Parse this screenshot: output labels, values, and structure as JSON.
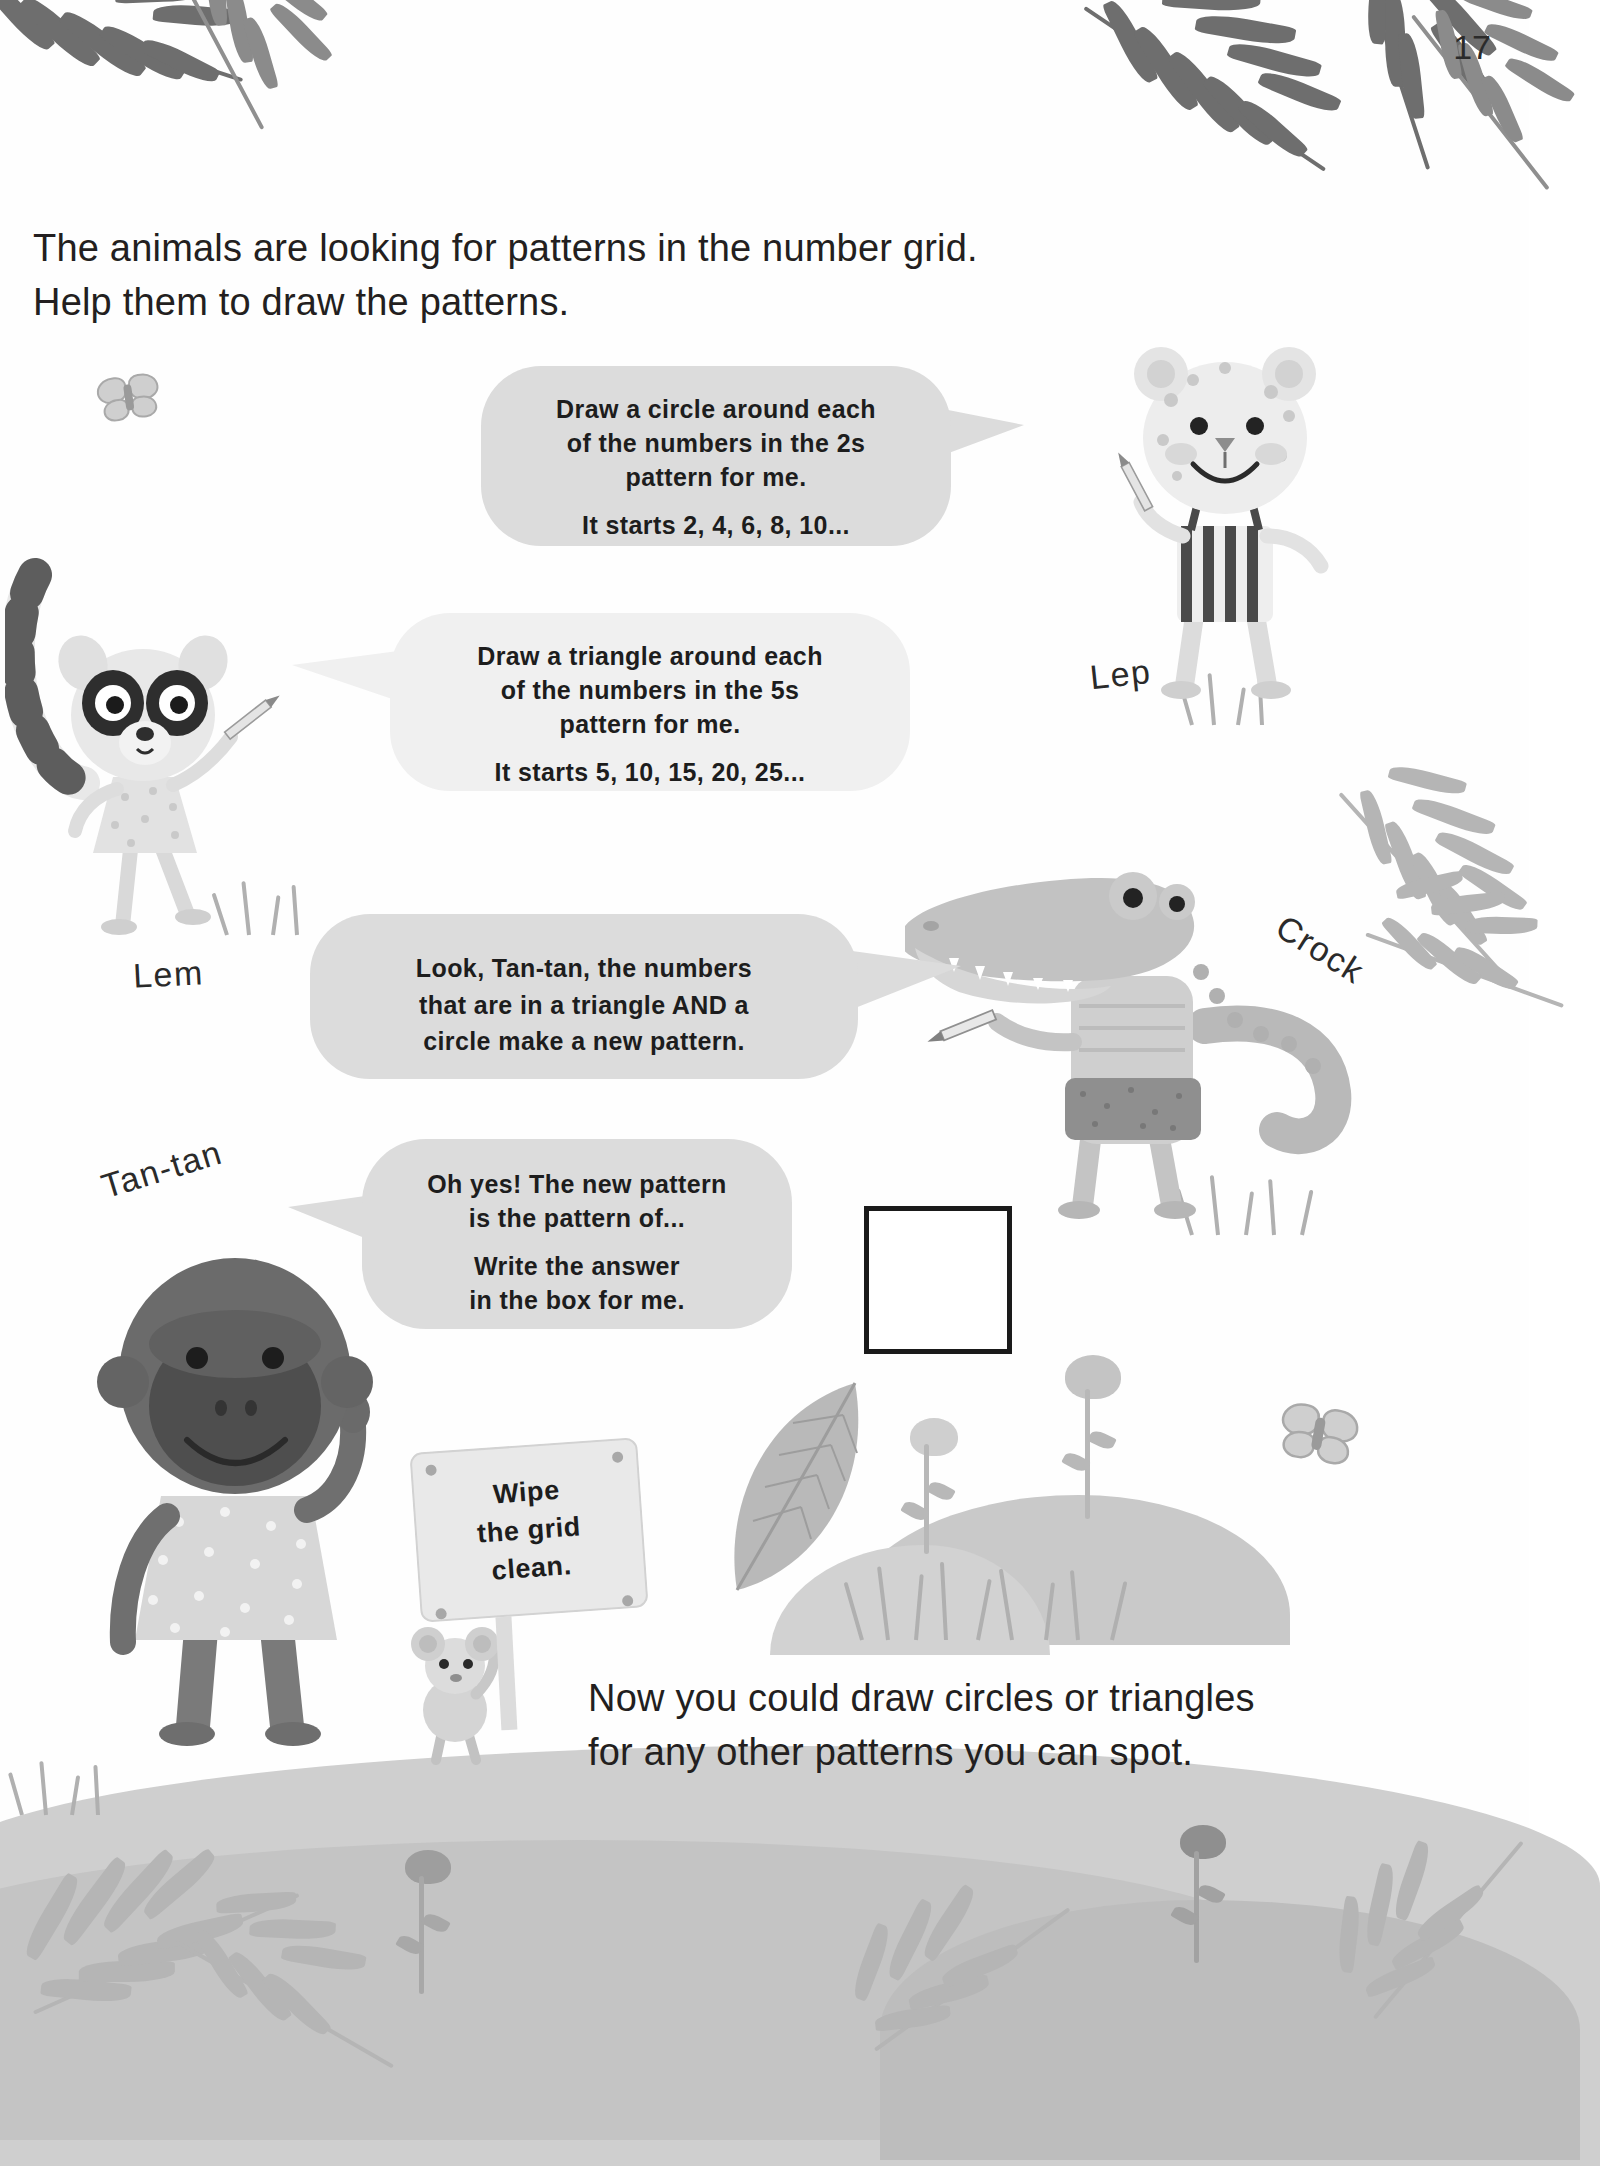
{
  "page": {
    "number": "17"
  },
  "intro": {
    "line1": "The animals are looking for patterns in the number grid.",
    "line2": "Help them to draw the patterns."
  },
  "closing": {
    "line1": "Now you could draw circles or triangles",
    "line2": "for any other patterns you can spot."
  },
  "bubbles": {
    "twos": {
      "line1": "Draw a circle around each",
      "line2": "of the numbers in the 2s",
      "line3": "pattern for me.",
      "line4": "It starts 2, 4, 6, 8, 10..."
    },
    "fives": {
      "line1": "Draw a triangle around each",
      "line2": "of the numbers in the 5s",
      "line3": "pattern for me.",
      "line4": "It starts 5, 10, 15, 20, 25..."
    },
    "combined": {
      "line1": "Look, Tan-tan, the numbers",
      "line2": "that are in a triangle AND a",
      "line3": "circle make a new pattern."
    },
    "answer": {
      "line1": "Oh yes! The new pattern",
      "line2": "is the pattern of...",
      "line3": "Write the answer",
      "line4": "in the box for me."
    }
  },
  "sign": {
    "line1": "Wipe",
    "line2": "the grid",
    "line3": "clean."
  },
  "characters": {
    "lep": "Lep",
    "lem": "Lem",
    "crock": "Crock",
    "tantan": "Tan-tan"
  },
  "answer_box": {
    "value": ""
  },
  "colors": {
    "bubble_fill": "#dcdcdc",
    "bubble_fill_light": "#f0f0f0",
    "text": "#231f20",
    "ground": "#cfcfcf",
    "box_border": "#1a1a1a"
  }
}
